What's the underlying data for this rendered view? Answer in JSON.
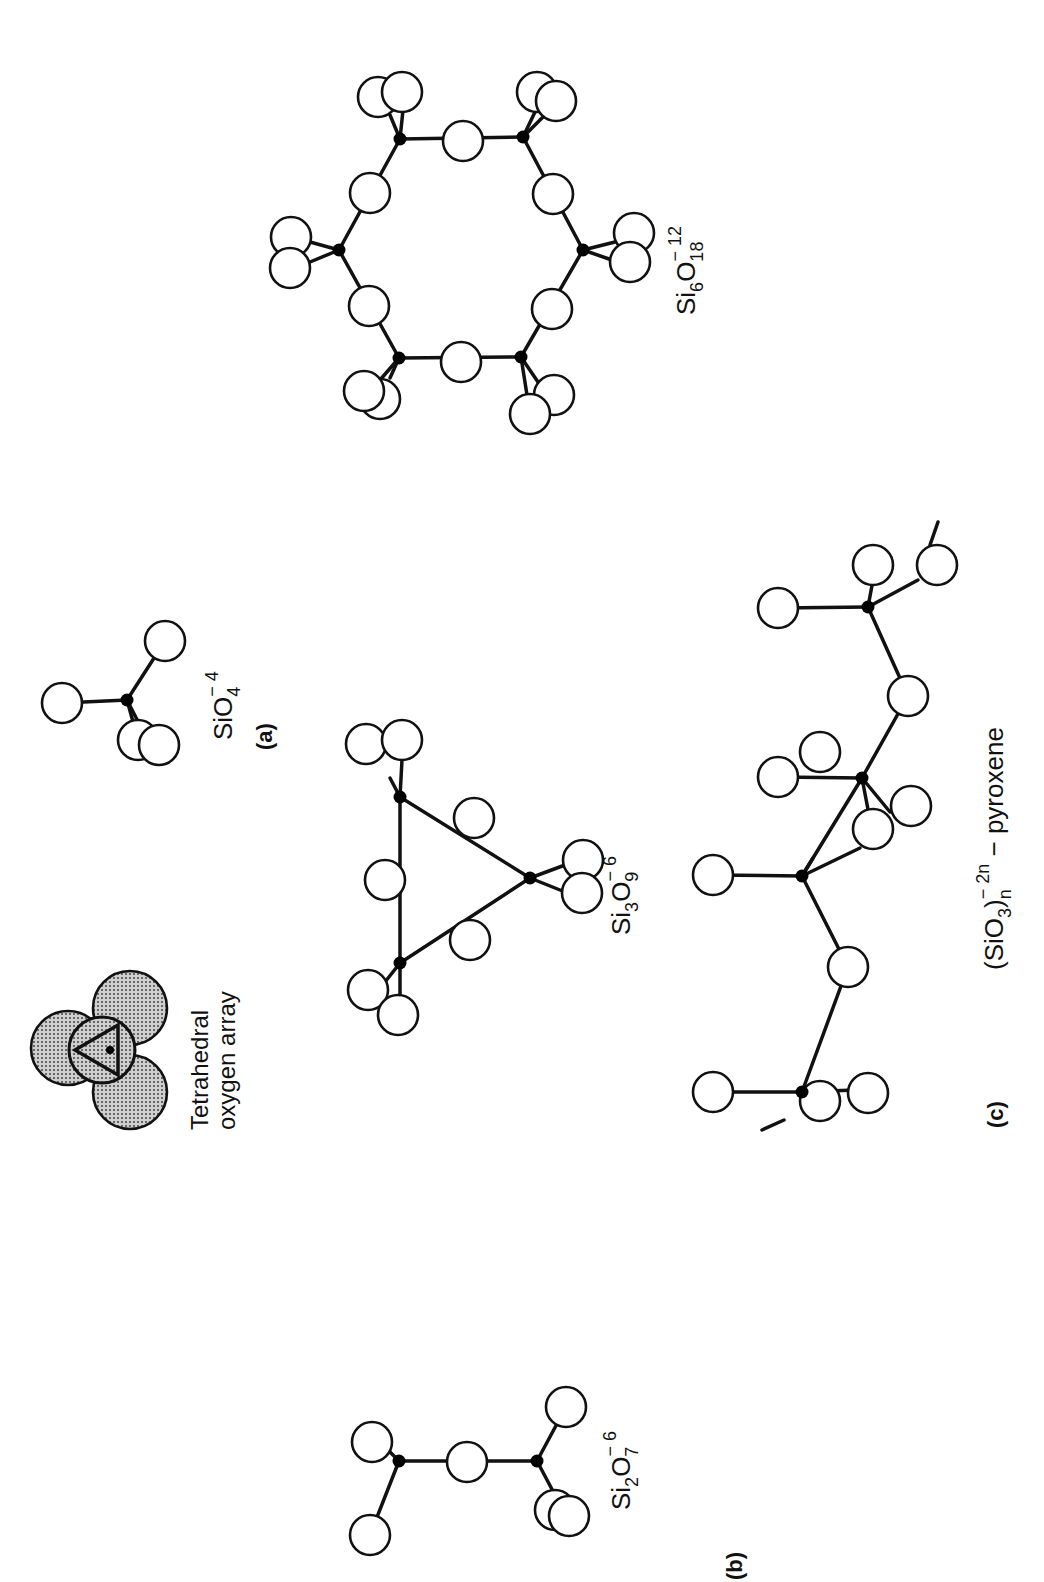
{
  "figure": {
    "orientation": "rotated 90 degrees counter-clockwise",
    "panels": [
      {
        "id": "a",
        "label": "(a)"
      },
      {
        "id": "b",
        "label": "(b)"
      },
      {
        "id": "c",
        "label": "(c)"
      }
    ],
    "labels": {
      "tetrahedral_line1": "Tetrahedral",
      "tetrahedral_line2": "oxygen array",
      "sio4": {
        "base": "SiO",
        "sub": "4",
        "sup": "− 4"
      },
      "si2o7": {
        "base1": "Si",
        "sub1": "2",
        "base2": "O",
        "sub2": "7",
        "sup": "− 6"
      },
      "si3o9": {
        "base1": "Si",
        "sub1": "3",
        "base2": "O",
        "sub2": "9",
        "sup": "− 6"
      },
      "si6o18": {
        "base1": "Si",
        "sub1": "6",
        "base2": "O",
        "sub2": "18",
        "sup": "− 12"
      },
      "pyroxene": {
        "base": "(SiO",
        "sub1": "3",
        "close": ")",
        "sub2": "n",
        "sup": "− 2n",
        "suffix": " − pyroxene"
      }
    },
    "colors": {
      "ink": "#111111",
      "background": "#ffffff",
      "shade": "#9a9a9a"
    }
  },
  "structures": {
    "sio4": {
      "si": [
        [
          127,
          700
        ]
      ],
      "oxygens": [
        [
          62,
          703
        ],
        [
          165,
          641
        ],
        [
          138,
          740
        ],
        [
          159,
          745
        ]
      ],
      "bonds": [
        [
          [
            127,
            700
          ],
          [
            62,
            703
          ]
        ],
        [
          [
            127,
            700
          ],
          [
            165,
            641
          ]
        ],
        [
          [
            127,
            700
          ],
          [
            138,
            740
          ]
        ],
        [
          [
            127,
            700
          ],
          [
            150,
            745
          ]
        ]
      ]
    },
    "si2o7": {
      "si": [
        [
          399,
          1461
        ],
        [
          537,
          1461
        ]
      ],
      "oxygens": [
        [
          372,
          1442
        ],
        [
          370,
          1535
        ],
        [
          467,
          1462
        ],
        [
          566,
          1407
        ],
        [
          555,
          1510
        ],
        [
          569,
          1516
        ]
      ],
      "bonds": [
        [
          [
            399,
            1461
          ],
          [
            537,
            1461
          ]
        ],
        [
          [
            399,
            1461
          ],
          [
            370,
            1535
          ]
        ],
        [
          [
            399,
            1461
          ],
          [
            380,
            1442
          ]
        ],
        [
          [
            537,
            1461
          ],
          [
            566,
            1407
          ]
        ],
        [
          [
            537,
            1461
          ],
          [
            555,
            1495
          ]
        ]
      ]
    },
    "si3o9": {
      "si": [
        [
          400,
          797
        ],
        [
          530,
          878
        ],
        [
          400,
          963
        ]
      ],
      "oxygens": [
        [
          385,
          880
        ],
        [
          474,
          818
        ],
        [
          470,
          940
        ],
        [
          366,
          744
        ],
        [
          402,
          740
        ],
        [
          583,
          860
        ],
        [
          582,
          893
        ],
        [
          368,
          990
        ],
        [
          398,
          1015
        ]
      ],
      "bonds": [
        [
          [
            400,
            797
          ],
          [
            530,
            878
          ]
        ],
        [
          [
            530,
            878
          ],
          [
            400,
            963
          ]
        ],
        [
          [
            400,
            963
          ],
          [
            400,
            797
          ]
        ],
        [
          [
            400,
            797
          ],
          [
            390,
            778
          ]
        ],
        [
          [
            400,
            797
          ],
          [
            402,
            760
          ]
        ],
        [
          [
            530,
            878
          ],
          [
            565,
            865
          ]
        ],
        [
          [
            530,
            878
          ],
          [
            565,
            892
          ]
        ],
        [
          [
            400,
            963
          ],
          [
            385,
            982
          ]
        ],
        [
          [
            400,
            963
          ],
          [
            400,
            1000
          ]
        ]
      ]
    },
    "si6o18": {
      "si": [
        [
          400,
          139
        ],
        [
          523,
          137
        ],
        [
          583,
          250
        ],
        [
          521,
          357
        ],
        [
          399,
          358
        ],
        [
          339,
          250
        ]
      ],
      "oxygens": [
        [
          463,
          141
        ],
        [
          553,
          194
        ],
        [
          552,
          309
        ],
        [
          461,
          362
        ],
        [
          369,
          306
        ],
        [
          370,
          193
        ],
        [
          378,
          97
        ],
        [
          402,
          92
        ],
        [
          537,
          92
        ],
        [
          556,
          101
        ],
        [
          634,
          233
        ],
        [
          630,
          262
        ],
        [
          554,
          395
        ],
        [
          530,
          414
        ],
        [
          380,
          399
        ],
        [
          364,
          391
        ],
        [
          291,
          237
        ],
        [
          290,
          268
        ]
      ],
      "bonds": [
        [
          [
            400,
            139
          ],
          [
            523,
            137
          ]
        ],
        [
          [
            523,
            137
          ],
          [
            583,
            250
          ]
        ],
        [
          [
            583,
            250
          ],
          [
            521,
            357
          ]
        ],
        [
          [
            521,
            357
          ],
          [
            399,
            358
          ]
        ],
        [
          [
            399,
            358
          ],
          [
            339,
            250
          ]
        ],
        [
          [
            339,
            250
          ],
          [
            400,
            139
          ]
        ],
        [
          [
            400,
            139
          ],
          [
            390,
            115
          ]
        ],
        [
          [
            400,
            139
          ],
          [
            403,
            110
          ]
        ],
        [
          [
            523,
            137
          ],
          [
            535,
            112
          ]
        ],
        [
          [
            523,
            137
          ],
          [
            545,
            115
          ]
        ],
        [
          [
            583,
            250
          ],
          [
            615,
            242
          ]
        ],
        [
          [
            583,
            250
          ],
          [
            612,
            260
          ]
        ],
        [
          [
            521,
            357
          ],
          [
            540,
            385
          ]
        ],
        [
          [
            521,
            357
          ],
          [
            527,
            395
          ]
        ],
        [
          [
            399,
            358
          ],
          [
            390,
            378
          ]
        ],
        [
          [
            399,
            358
          ],
          [
            380,
            380
          ]
        ],
        [
          [
            339,
            250
          ],
          [
            310,
            242
          ]
        ],
        [
          [
            339,
            250
          ],
          [
            310,
            262
          ]
        ]
      ]
    },
    "pyroxene": {
      "si": [
        [
          802,
          1092
        ],
        [
          802,
          876
        ],
        [
          862,
          778
        ],
        [
          868,
          607
        ]
      ],
      "oxygens": [
        [
          713,
          1092
        ],
        [
          820,
          1101
        ],
        [
          868,
          1093
        ],
        [
          848,
          967
        ],
        [
          713,
          875
        ],
        [
          820,
          752
        ],
        [
          873,
          829
        ],
        [
          911,
          806
        ],
        [
          778,
          777
        ],
        [
          908,
          696
        ],
        [
          778,
          608
        ],
        [
          873,
          565
        ],
        [
          937,
          565
        ]
      ],
      "bonds": [
        [
          [
            802,
            1092
          ],
          [
            713,
            1092
          ]
        ],
        [
          [
            802,
            1092
          ],
          [
            848,
            967
          ]
        ],
        [
          [
            848,
            967
          ],
          [
            802,
            876
          ]
        ],
        [
          [
            802,
            876
          ],
          [
            713,
            875
          ]
        ],
        [
          [
            802,
            876
          ],
          [
            862,
            778
          ]
        ],
        [
          [
            862,
            778
          ],
          [
            778,
            777
          ]
        ],
        [
          [
            862,
            778
          ],
          [
            908,
            696
          ]
        ],
        [
          [
            908,
            696
          ],
          [
            868,
            607
          ]
        ],
        [
          [
            868,
            607
          ],
          [
            778,
            608
          ]
        ],
        [
          [
            802,
            1092
          ],
          [
            855,
            1090
          ]
        ],
        [
          [
            802,
            1092
          ],
          [
            815,
            1110
          ]
        ],
        [
          [
            802,
            876
          ],
          [
            860,
            848
          ]
        ],
        [
          [
            802,
            876
          ],
          [
            813,
            858
          ]
        ],
        [
          [
            862,
            778
          ],
          [
            890,
            812
          ]
        ],
        [
          [
            862,
            778
          ],
          [
            870,
            820
          ]
        ],
        [
          [
            868,
            607
          ],
          [
            918,
            580
          ]
        ],
        [
          [
            868,
            607
          ],
          [
            873,
            580
          ]
        ],
        [
          [
            762,
            1130
          ],
          [
            784,
            1120
          ]
        ],
        [
          [
            930,
            545
          ],
          [
            938,
            522
          ]
        ]
      ]
    },
    "tetrahedral_array": {
      "centers": [
        [
          68,
          1048
        ],
        [
          130,
          1008
        ],
        [
          130,
          1092
        ]
      ],
      "radius": 37
    }
  }
}
